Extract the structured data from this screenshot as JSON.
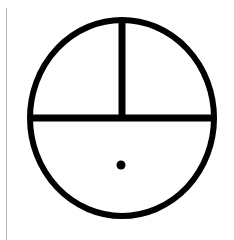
{
  "symbol": {
    "name": "circle-with-cross-bars-and-dot",
    "stroke_color": "#000000",
    "background_color": "#ffffff",
    "frame_line_color": "#b8b8b8",
    "circle": {
      "cx": 122,
      "cy": 118,
      "rx": 92,
      "ry": 98,
      "stroke_width": 6
    },
    "horizontal_bar": {
      "x1": 30,
      "y1": 118,
      "x2": 214,
      "y2": 118,
      "stroke_width": 7
    },
    "vertical_bar": {
      "x1": 122,
      "y1": 21,
      "x2": 122,
      "y2": 118,
      "stroke_width": 7
    },
    "dot": {
      "cx": 121,
      "cy": 165,
      "r": 4.5
    }
  }
}
